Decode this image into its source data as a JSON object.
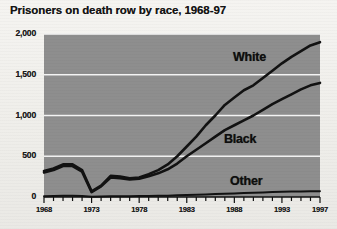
{
  "title": "Prisoners on death row by race, 1968-97",
  "chart_data": {
    "type": "line",
    "title": "Prisoners on death row by race, 1968-97",
    "xlabel": "",
    "ylabel": "",
    "xlim": [
      1968,
      1997
    ],
    "ylim": [
      0,
      2000
    ],
    "grid": true,
    "legend_position": "inline-labels",
    "y_ticks": [
      "0",
      "500",
      "1,000",
      "1,500",
      "2,000"
    ],
    "y_tick_values": [
      0,
      500,
      1000,
      1500,
      2000
    ],
    "x_ticks": [
      "1968",
      "1973",
      "1978",
      "1983",
      "1988",
      "1993",
      "1997"
    ],
    "x_tick_values": [
      1968,
      1973,
      1978,
      1983,
      1988,
      1993,
      1997
    ],
    "x": [
      1968,
      1969,
      1970,
      1971,
      1972,
      1973,
      1974,
      1975,
      1976,
      1977,
      1978,
      1979,
      1980,
      1981,
      1982,
      1983,
      1984,
      1985,
      1986,
      1987,
      1988,
      1989,
      1990,
      1991,
      1992,
      1993,
      1994,
      1995,
      1996,
      1997
    ],
    "series": [
      {
        "name": "White",
        "label": "White",
        "values": [
          320,
          350,
          400,
          400,
          330,
          70,
          140,
          260,
          250,
          230,
          240,
          280,
          330,
          400,
          500,
          620,
          740,
          880,
          1000,
          1130,
          1220,
          1310,
          1370,
          1460,
          1550,
          1640,
          1720,
          1790,
          1860,
          1900
        ]
      },
      {
        "name": "Black",
        "label": "Black",
        "values": [
          300,
          330,
          380,
          380,
          310,
          60,
          130,
          240,
          230,
          215,
          225,
          255,
          290,
          340,
          410,
          500,
          580,
          660,
          740,
          820,
          880,
          940,
          1000,
          1070,
          1140,
          1200,
          1260,
          1320,
          1370,
          1400
        ]
      },
      {
        "name": "Other",
        "label": "Other",
        "values": [
          10,
          12,
          14,
          14,
          12,
          3,
          6,
          10,
          10,
          10,
          11,
          12,
          14,
          16,
          20,
          24,
          28,
          32,
          36,
          40,
          44,
          48,
          52,
          56,
          60,
          64,
          66,
          68,
          70,
          72
        ]
      }
    ]
  },
  "colors": {
    "plot_background": "#8e8e8e",
    "gridline": "#f4f4f4",
    "line": "#121212",
    "text": "#141414",
    "page_background": "#f2f1ee"
  }
}
